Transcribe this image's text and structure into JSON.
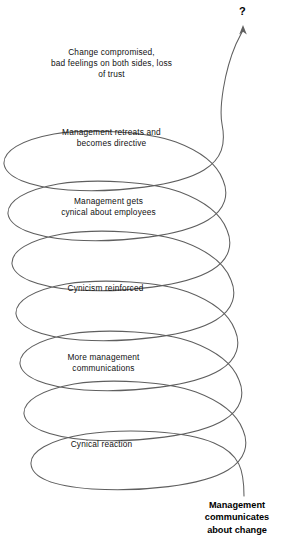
{
  "diagram": {
    "type": "spiral-flow",
    "background_color": "#ffffff",
    "line_color": "#5f5f5f",
    "text_color": "#111111",
    "terminator": {
      "symbol": "?",
      "name": "question-mark",
      "position": "top-right"
    },
    "start_label": "Management\ncommunicates\nabout change",
    "loops": [
      {
        "index": 1,
        "label": "Change compromised,\nbad feelings on both sides, loss\nof trust"
      },
      {
        "index": 2,
        "label": "Management retreats and\nbecomes directive"
      },
      {
        "index": 3,
        "label": "Management gets\ncynical about employees"
      },
      {
        "index": 4,
        "label": "Cynicism reinforced"
      },
      {
        "index": 5,
        "label": "More management\ncommunications"
      },
      {
        "index": 6,
        "label": "Cynical reaction"
      }
    ]
  }
}
